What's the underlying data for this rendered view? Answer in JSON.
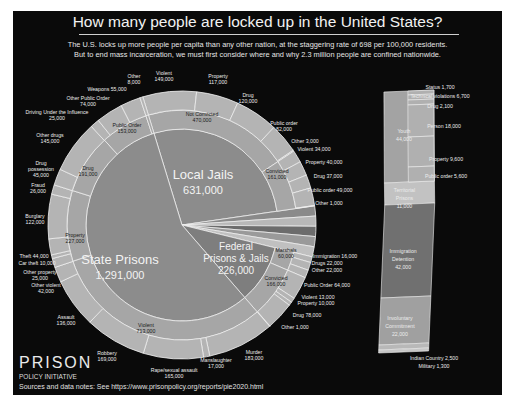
{
  "header": {
    "title": "How many people are locked up in the United States?",
    "subtitle_line1": "The  U.S. locks up more people per capita than any other nation, at the staggering rate of 698 per 100,000 residents.",
    "subtitle_line2": "But to end mass incarceration, we must first consider where and why 2.3 million people are confined nationwide."
  },
  "footer": {
    "logo": "PRISON",
    "logo_sub": "POLICY INITIATIVE",
    "sources": "Sources and data notes: See https://www.prisonpolicy.org/reports/pie2020.html"
  },
  "colors": {
    "background": "#0a0a0a",
    "inner_pie": "#8c8c8c",
    "ring_mid": "#a6a6a6",
    "ring_outer": "#b4b4b4",
    "federal": "#7e7e7e",
    "immigration": "#6e6e6e",
    "territorial": "#bdbdbd",
    "separator": "#f0f0f0"
  },
  "chart_data": {
    "type": "pie",
    "title": "How many people are locked up in the United States?",
    "total": 2300000,
    "center_slices": [
      {
        "name": "Local Jails",
        "value": 631000,
        "label": "631,000"
      },
      {
        "name": "Federal Prisons & Jails",
        "value": 226000,
        "label": "226,000"
      },
      {
        "name": "State Prisons",
        "value": 1291000,
        "label": "1,291,000"
      }
    ],
    "local_jails": {
      "middle_ring": [
        {
          "name": "Not Convicted",
          "value": 470000
        },
        {
          "name": "Convicted",
          "value": 161000
        }
      ],
      "outer_ring_not_convicted": [
        {
          "name": "Violent",
          "value": 149000
        },
        {
          "name": "Property",
          "value": 117000
        },
        {
          "name": "Drug",
          "value": 120000
        },
        {
          "name": "Public order",
          "value": 82000
        },
        {
          "name": "Other",
          "value": 3000
        }
      ],
      "outer_ring_convicted": [
        {
          "name": "Violent",
          "value": 34000
        },
        {
          "name": "Property",
          "value": 40000
        },
        {
          "name": "Drug",
          "value": 37000
        },
        {
          "name": "Public order",
          "value": 49000
        },
        {
          "name": "Other",
          "value": 1000
        }
      ]
    },
    "federal": {
      "middle_ring": [
        {
          "name": "Marshals",
          "value": 60000
        },
        {
          "name": "Convicted",
          "value": 166000
        }
      ],
      "outer_ring_marshals": [
        {
          "name": "Immigration",
          "value": 16000
        },
        {
          "name": "Drugs",
          "value": 22000
        },
        {
          "name": "Other",
          "value": 22000
        }
      ],
      "outer_ring_convicted": [
        {
          "name": "Public Order",
          "value": 64000
        },
        {
          "name": "Violent",
          "value": 13000
        },
        {
          "name": "Property",
          "value": 10000
        },
        {
          "name": "Drug",
          "value": 78000
        },
        {
          "name": "Other",
          "value": 1000
        }
      ]
    },
    "state_prisons": {
      "middle_ring": [
        {
          "name": "Violent",
          "value": 713000
        },
        {
          "name": "Property",
          "value": 227000
        },
        {
          "name": "Drug",
          "value": 191000
        },
        {
          "name": "Public Order",
          "value": 153000
        },
        {
          "name": "Other",
          "value": 8000
        }
      ],
      "outer_ring": [
        {
          "name": "Murder",
          "value": 183000
        },
        {
          "name": "Manslaughter",
          "value": 17000
        },
        {
          "name": "Rape/sexual assault",
          "value": 165000
        },
        {
          "name": "Robbery",
          "value": 169000
        },
        {
          "name": "Assault",
          "value": 136000
        },
        {
          "name": "Other violent",
          "value": 42000
        },
        {
          "name": "Other property",
          "value": 25000
        },
        {
          "name": "Car theft",
          "value": 10000
        },
        {
          "name": "Theft",
          "value": 44000
        },
        {
          "name": "Burglary",
          "value": 122000
        },
        {
          "name": "Fraud",
          "value": 26000
        },
        {
          "name": "Drug possession",
          "value": 45000
        },
        {
          "name": "Other drugs",
          "value": 145000
        },
        {
          "name": "Driving Under the Influence",
          "value": 25000
        },
        {
          "name": "Other Public Order",
          "value": 74000
        },
        {
          "name": "Weapons",
          "value": 55000
        },
        {
          "name": "Other",
          "value": 8000
        }
      ]
    },
    "other_systems": [
      {
        "name": "Youth",
        "value": 44000,
        "sub": [
          {
            "name": "Status",
            "value": 1700
          },
          {
            "name": "Technical violations",
            "value": 6700
          },
          {
            "name": "Drug",
            "value": 2100
          },
          {
            "name": "Person",
            "value": 18000
          },
          {
            "name": "Property",
            "value": 9600
          },
          {
            "name": "Public order",
            "value": 5600
          }
        ]
      },
      {
        "name": "Territorial Prisons",
        "value": 11000
      },
      {
        "name": "Immigration Detention",
        "value": 42000
      },
      {
        "name": "Involuntary Commitment",
        "value": 22000
      },
      {
        "name": "Indian Country",
        "value": 2500
      },
      {
        "name": "Military",
        "value": 1300
      }
    ]
  },
  "labels": {
    "center": {
      "local_title": "Local Jails",
      "local_value": "631,000",
      "state_title": "State Prisons",
      "state_value": "1,291,000",
      "federal_title1": "Federal",
      "federal_title2": "Prisons & Jails",
      "federal_value": "226,000"
    },
    "ring": [
      {
        "t1": "Not Convicted",
        "t2": "470,000",
        "x": 202,
        "y": 116,
        "dark": true
      },
      {
        "t1": "Convicted",
        "t2": "161,000",
        "x": 277,
        "y": 173,
        "dark": true
      },
      {
        "t1": "Marshals",
        "t2": "60,000",
        "x": 286,
        "y": 252,
        "dark": true
      },
      {
        "t1": "Convicted",
        "t2": "166,000",
        "x": 276,
        "y": 280,
        "dark": true
      },
      {
        "t1": "Violent",
        "t2": "713,000",
        "x": 146,
        "y": 327,
        "dark": true
      },
      {
        "t1": "Property",
        "t2": "227,000",
        "x": 75,
        "y": 237,
        "dark": true
      },
      {
        "t1": "Drug",
        "t2": "191,000",
        "x": 88,
        "y": 170,
        "dark": true
      },
      {
        "t1": "Public Order",
        "t2": "153,000",
        "x": 127,
        "y": 127,
        "dark": true
      }
    ],
    "outer": [
      {
        "t1": "Violent",
        "t2": "149,000",
        "x": 164,
        "y": 75
      },
      {
        "t1": "Property",
        "t2": "117,000",
        "x": 218,
        "y": 78
      },
      {
        "t1": "Drug",
        "t2": "120,000",
        "x": 248,
        "y": 97
      },
      {
        "t1": "Public order",
        "t2": "82,000",
        "x": 284,
        "y": 125
      },
      {
        "t1": "Other 3,000",
        "t2": "",
        "x": 305,
        "y": 143
      },
      {
        "t1": "Violent 34,000",
        "t2": "",
        "x": 314,
        "y": 151
      },
      {
        "t1": "Property 40,000",
        "t2": "",
        "x": 324,
        "y": 164
      },
      {
        "t1": "Drug 37,000",
        "t2": "",
        "x": 328,
        "y": 178
      },
      {
        "t1": "Public order 49,000",
        "t2": "",
        "x": 330,
        "y": 192
      },
      {
        "t1": "Other 1,000",
        "t2": "",
        "x": 329,
        "y": 205
      },
      {
        "t1": "Immigration 16,000",
        "t2": "",
        "x": 335,
        "y": 258
      },
      {
        "t1": "Drugs 22,000",
        "t2": "",
        "x": 327,
        "y": 265
      },
      {
        "t1": "Other 22,000",
        "t2": "",
        "x": 327,
        "y": 272
      },
      {
        "t1": "Public Order 64,000",
        "t2": "",
        "x": 327,
        "y": 287
      },
      {
        "t1": "Violent 13,000",
        "t2": "",
        "x": 318,
        "y": 299
      },
      {
        "t1": "Property 10,000",
        "t2": "",
        "x": 316,
        "y": 305
      },
      {
        "t1": "Drug 78,000",
        "t2": "",
        "x": 307,
        "y": 317
      },
      {
        "t1": "Other 1,000",
        "t2": "",
        "x": 295,
        "y": 329
      },
      {
        "t1": "Murder",
        "t2": "183,000",
        "x": 254,
        "y": 354
      },
      {
        "t1": "Manslaughter",
        "t2": "17,000",
        "x": 216,
        "y": 362
      },
      {
        "t1": "Rape/sexual assault",
        "t2": "165,000",
        "x": 174,
        "y": 372
      },
      {
        "t1": "Robbery",
        "t2": "169,000",
        "x": 107,
        "y": 355
      },
      {
        "t1": "Assault",
        "t2": "136,000",
        "x": 66,
        "y": 319
      },
      {
        "t1": "Other violent",
        "t2": "42,000",
        "x": 46,
        "y": 287
      },
      {
        "t1": "Other property",
        "t2": "25,000",
        "x": 40,
        "y": 274
      },
      {
        "t1": "Car theft 10,000",
        "t2": "",
        "x": 37,
        "y": 265
      },
      {
        "t1": "Theft 44,000",
        "t2": "",
        "x": 34,
        "y": 258
      },
      {
        "t1": "Burglary",
        "t2": "122,000",
        "x": 35,
        "y": 218
      },
      {
        "t1": "Fraud",
        "t2": "26,000",
        "x": 38,
        "y": 187
      },
      {
        "t1": "Drug",
        "t2": "possession",
        "t3": "45,000",
        "x": 41,
        "y": 165
      },
      {
        "t1": "Other drugs",
        "t2": "145,000",
        "x": 50,
        "y": 137
      },
      {
        "t1": "Driving Under the Influence",
        "t2": "25,000",
        "x": 57,
        "y": 114
      },
      {
        "t1": "Other Public Order",
        "t2": "74,000",
        "x": 88,
        "y": 100
      },
      {
        "t1": "Weapons 55,000",
        "t2": "",
        "x": 107,
        "y": 91
      },
      {
        "t1": "Other",
        "t2": "8,000",
        "x": 134,
        "y": 78
      }
    ],
    "side": [
      {
        "t1": "Status 1,700",
        "x": 440,
        "y": 89,
        "anchor": "start"
      },
      {
        "t1": "Technical violations 6,700",
        "x": 440,
        "y": 98,
        "anchor": "start"
      },
      {
        "t1": "Drug 2,100",
        "x": 440,
        "y": 108,
        "anchor": "start"
      },
      {
        "t1": "Person 18,000",
        "x": 444,
        "y": 128,
        "anchor": "start"
      },
      {
        "t1": "Property 9,600",
        "x": 446,
        "y": 161,
        "anchor": "start"
      },
      {
        "t1": "Public order 5,600",
        "x": 446,
        "y": 178,
        "anchor": "start"
      },
      {
        "t1": "Indian Country 2,500",
        "x": 434,
        "y": 360,
        "anchor": "start"
      },
      {
        "t1": "Military 1,300",
        "x": 434,
        "y": 368,
        "anchor": "start"
      }
    ],
    "bar_blocks": [
      {
        "t1": "Youth",
        "t2": "44,000",
        "t3": "",
        "y": 133
      },
      {
        "t1": "Territorial",
        "t2": "Prisons",
        "t3": "11,000",
        "y": 192
      },
      {
        "t1": "Immigration",
        "t2": "Detention",
        "t3": "42,000",
        "y": 253
      },
      {
        "t1": "Involuntary",
        "t2": "Commitment",
        "t3": "22,000",
        "y": 320
      }
    ]
  }
}
